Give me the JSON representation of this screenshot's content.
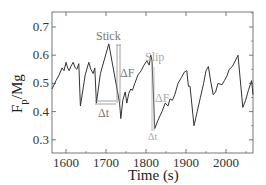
{
  "chart_data": {
    "type": "line",
    "title": "",
    "xlabel": "Time (s)",
    "ylabel": "F_p/Mg",
    "ylabel_main": "F",
    "ylabel_sub": "p",
    "ylabel_rest": "/Mg",
    "xlim": [
      1565,
      2068
    ],
    "ylim": [
      0.26,
      0.755
    ],
    "xticks": [
      1600,
      1700,
      1800,
      1900,
      2000
    ],
    "xtick_labels": [
      "1600",
      "1700",
      "1800",
      "1900",
      "2000"
    ],
    "yticks": [
      0.3,
      0.4,
      0.5,
      0.6,
      0.7
    ],
    "ytick_labels": [
      "0.3",
      "0.4",
      "0.5",
      "0.6",
      "0.7"
    ],
    "grid": false,
    "legend": null,
    "series": [
      {
        "name": "F_p/Mg",
        "color": "#333333",
        "x": [
          1565,
          1575,
          1583,
          1590,
          1595,
          1600,
          1604,
          1608,
          1612,
          1618,
          1623,
          1627,
          1632,
          1636,
          1648,
          1657,
          1662,
          1668,
          1672,
          1676,
          1686,
          1707,
          1734,
          1737,
          1742,
          1748,
          1752,
          1757,
          1762,
          1766,
          1772,
          1780,
          1788,
          1795,
          1802,
          1808,
          1812,
          1815,
          1822,
          1830,
          1840,
          1848,
          1855,
          1860,
          1866,
          1872,
          1880,
          1888,
          1896,
          1902,
          1906,
          1910,
          1920,
          1928,
          1936,
          1944,
          1950,
          1956,
          1962,
          1968,
          1974,
          1980,
          1990,
          1996,
          2002,
          2008,
          2016,
          2030,
          2042,
          2049,
          2056,
          2064,
          2068
        ],
        "values": [
          0.48,
          0.51,
          0.53,
          0.555,
          0.545,
          0.575,
          0.555,
          0.545,
          0.56,
          0.575,
          0.555,
          0.55,
          0.57,
          0.42,
          0.53,
          0.575,
          0.55,
          0.535,
          0.555,
          0.43,
          0.535,
          0.64,
          0.43,
          0.375,
          0.44,
          0.47,
          0.43,
          0.465,
          0.48,
          0.475,
          0.5,
          0.53,
          0.545,
          0.565,
          0.58,
          0.565,
          0.6,
          0.58,
          0.34,
          0.37,
          0.4,
          0.43,
          0.42,
          0.445,
          0.44,
          0.46,
          0.5,
          0.52,
          0.54,
          0.545,
          0.49,
          0.49,
          0.35,
          0.4,
          0.45,
          0.5,
          0.545,
          0.56,
          0.505,
          0.46,
          0.47,
          0.5,
          0.495,
          0.51,
          0.525,
          0.55,
          0.56,
          0.6,
          0.415,
          0.44,
          0.475,
          0.51,
          0.46
        ]
      }
    ],
    "annotations": [
      {
        "text": "Stick",
        "x": 1725,
        "y": 0.66,
        "color": "#777777"
      },
      {
        "text": "ΔF",
        "x": 1745,
        "y": 0.525,
        "color": "#777777"
      },
      {
        "text": "Δt",
        "x": 1710,
        "y": 0.42,
        "color": "#777777"
      },
      {
        "text": "Slip",
        "x": 1815,
        "y": 0.61,
        "color": "#aaaaaa"
      },
      {
        "text": "ΔF",
        "x": 1835,
        "y": 0.48,
        "color": "#aaaaaa"
      },
      {
        "text": "Δt",
        "x": 1822,
        "y": 0.315,
        "color": "#aaaaaa"
      }
    ]
  },
  "labels": {
    "ylabel_main": "F",
    "ylabel_sub": "p",
    "ylabel_rest": "/Mg",
    "xlabel": "Time (s)",
    "stick": "Stick",
    "slip": "Slip",
    "delta_f": "ΔF",
    "delta_t": "Δt"
  }
}
